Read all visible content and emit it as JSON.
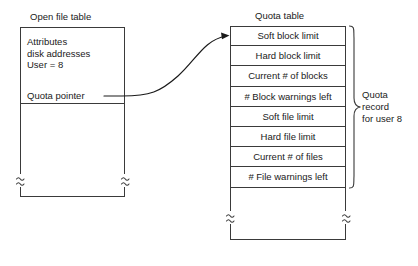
{
  "diagram": {
    "left_table": {
      "caption": "Open file table",
      "fields": [
        "Attributes",
        "disk addresses",
        "User = 8"
      ],
      "pointer_label": "Quota pointer"
    },
    "right_table": {
      "caption": "Quota table",
      "rows": [
        "Soft block limit",
        "Hard block limit",
        "Current # of blocks",
        "# Block warnings left",
        "Soft file limit",
        "Hard file limit",
        "Current # of files",
        "# File warnings left"
      ]
    },
    "annotation": {
      "bracket_label_lines": [
        "Quota",
        "record",
        "for user 8"
      ]
    },
    "icons": {
      "connector": "curved-arrow-icon",
      "bracket": "curly-brace-icon",
      "break_mark": "table-break-icon"
    },
    "colors": {
      "stroke": "#3a3a3a",
      "text": "#1a1a1a",
      "background": "#ffffff"
    }
  }
}
